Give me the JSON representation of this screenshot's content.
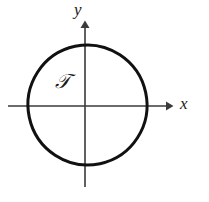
{
  "figure": {
    "width": 209,
    "height": 202,
    "background_color": "#ffffff",
    "stroke_color": "#111111",
    "axis_color": "#3a3a3a"
  },
  "axes": {
    "x_label": "x",
    "y_label": "y",
    "x_axis": {
      "y": 106,
      "x_start": 8,
      "x_end": 172
    },
    "y_axis": {
      "x": 85,
      "y_start": 22,
      "y_end": 187
    }
  },
  "region": {
    "label": "𝒯",
    "shape": "closed-oval-curve",
    "bounds": {
      "left": 28,
      "right": 147,
      "top": 45,
      "bottom": 165
    },
    "rotation_deg": -12,
    "stroke_width": 3
  }
}
